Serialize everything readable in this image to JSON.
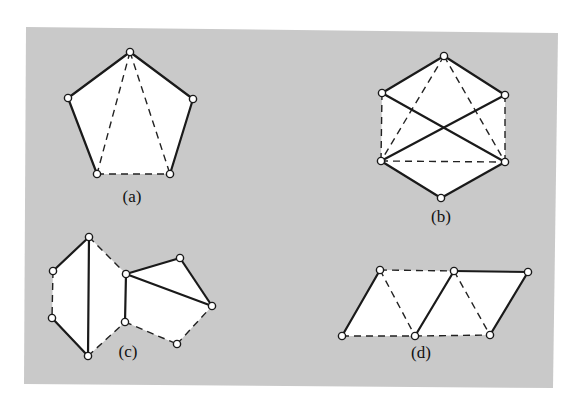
{
  "background": {
    "panel_color": "#c9c9c9",
    "face_color": "#ffffff",
    "line_color": "#1a1a1a"
  },
  "panel": {
    "points": [
      [
        26,
        27
      ],
      [
        558,
        33
      ],
      [
        553,
        388
      ],
      [
        24,
        384
      ]
    ]
  },
  "figures": [
    {
      "id": "a",
      "label": "(a)",
      "label_pos": [
        132,
        202
      ],
      "vertices": [
        [
          130,
          52
        ],
        [
          68,
          98
        ],
        [
          97,
          174
        ],
        [
          170,
          174
        ],
        [
          193,
          99
        ]
      ],
      "outline": [
        0,
        1,
        2,
        3,
        4
      ],
      "solid_edges": [
        [
          0,
          1
        ],
        [
          1,
          2
        ],
        [
          0,
          4
        ],
        [
          4,
          3
        ]
      ],
      "dashed_edges": [
        [
          2,
          3
        ],
        [
          0,
          2
        ],
        [
          0,
          3
        ]
      ]
    },
    {
      "id": "b",
      "label": "(b)",
      "label_pos": [
        441,
        222
      ],
      "vertices": [
        [
          444,
          56
        ],
        [
          382,
          93
        ],
        [
          505,
          95
        ],
        [
          381,
          161
        ],
        [
          505,
          162
        ],
        [
          441,
          198
        ]
      ],
      "outline": [
        0,
        2,
        4,
        5,
        3,
        1
      ],
      "solid_edges": [
        [
          0,
          1
        ],
        [
          0,
          2
        ],
        [
          1,
          4
        ],
        [
          2,
          3
        ],
        [
          3,
          5
        ],
        [
          4,
          5
        ]
      ],
      "dashed_edges": [
        [
          1,
          3
        ],
        [
          2,
          4
        ],
        [
          0,
          3
        ],
        [
          0,
          4
        ],
        [
          3,
          4
        ]
      ]
    },
    {
      "id": "c",
      "label": "(c)",
      "label_pos": [
        128,
        357
      ],
      "vertices": [
        [
          89,
          237
        ],
        [
          53,
          271
        ],
        [
          52,
          318
        ],
        [
          88,
          356
        ],
        [
          126,
          274
        ],
        [
          125,
          322
        ],
        [
          180,
          258
        ],
        [
          212,
          306
        ],
        [
          177,
          344
        ]
      ],
      "outline": [
        0,
        4,
        6,
        7,
        8,
        5,
        3,
        2,
        1
      ],
      "solid_edges": [
        [
          0,
          1
        ],
        [
          0,
          3
        ],
        [
          2,
          3
        ],
        [
          4,
          5
        ],
        [
          4,
          6
        ],
        [
          6,
          7
        ],
        [
          4,
          7
        ]
      ],
      "dashed_edges": [
        [
          1,
          2
        ],
        [
          0,
          4
        ],
        [
          3,
          5
        ],
        [
          5,
          8
        ],
        [
          8,
          7
        ]
      ]
    },
    {
      "id": "d",
      "label": "(d)",
      "label_pos": [
        421,
        358
      ],
      "vertices": [
        [
          380,
          270
        ],
        [
          454,
          271
        ],
        [
          528,
          272
        ],
        [
          342,
          336
        ],
        [
          415,
          336
        ],
        [
          490,
          335
        ]
      ],
      "outline": [
        0,
        1,
        2,
        5,
        4,
        3
      ],
      "solid_edges": [
        [
          3,
          0
        ],
        [
          4,
          1
        ],
        [
          1,
          2
        ],
        [
          2,
          5
        ]
      ],
      "dashed_edges": [
        [
          0,
          1
        ],
        [
          0,
          4
        ],
        [
          1,
          5
        ],
        [
          3,
          4
        ],
        [
          4,
          5
        ]
      ]
    }
  ]
}
